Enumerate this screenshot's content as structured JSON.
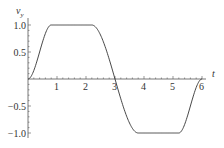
{
  "chart_data": {
    "type": "line",
    "title": "",
    "xlabel": "t",
    "ylabel": "v_y",
    "xlim": [
      0,
      6.1
    ],
    "ylim": [
      -1.05,
      1.05
    ],
    "x_ticks": [
      "1",
      "2",
      "3",
      "4",
      "5",
      "6"
    ],
    "y_ticks": [
      "1.0",
      "0.5",
      "-0.5",
      "-1.0"
    ],
    "grid": false,
    "legend": null,
    "series": [
      {
        "name": "v_y(t)",
        "x": [
          0,
          0.2,
          0.4,
          0.6,
          0.8,
          1.0,
          1.5,
          2.0,
          2.2,
          2.4,
          2.6,
          2.8,
          3.0,
          3.2,
          3.4,
          3.6,
          3.8,
          4.0,
          4.5,
          5.0,
          5.2,
          5.4,
          5.6,
          5.8,
          6.0
        ],
        "values": [
          0,
          0.1,
          0.5,
          0.9,
          1.0,
          1.0,
          1.0,
          1.0,
          1.0,
          0.9,
          0.5,
          0.1,
          0,
          -0.1,
          -0.5,
          -0.9,
          -1.0,
          -1.0,
          -1.0,
          -1.0,
          -1.0,
          -0.9,
          -0.5,
          -0.1,
          0
        ]
      }
    ]
  },
  "labels": {
    "x_axis": "t",
    "y_axis_main": "v",
    "y_axis_sub": "y",
    "x_ticks": [
      "1",
      "2",
      "3",
      "4",
      "5",
      "6"
    ],
    "y_ticks": [
      "1.0",
      "0.5",
      "−0.5",
      "−1.0"
    ]
  }
}
